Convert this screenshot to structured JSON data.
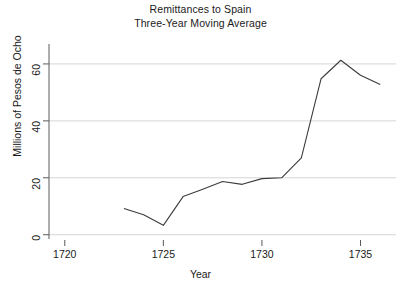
{
  "chart_data": {
    "type": "line",
    "title": "Remittances to Spain",
    "subtitle": "Three-Year Moving Average",
    "xlabel": "Year",
    "ylabel": "Millions of Pesos de Ocho",
    "xlim": [
      1719.2,
      1736.8
    ],
    "ylim": [
      -1.5,
      67
    ],
    "grid": true,
    "gridlines_y": [
      0,
      20,
      40,
      60
    ],
    "legend": null,
    "xticks": [
      1720,
      1725,
      1730,
      1735
    ],
    "xtick_labels": [
      "1720",
      "1725",
      "1730",
      "1735"
    ],
    "yticks": [
      0,
      20,
      40,
      60
    ],
    "ytick_labels": [
      "0",
      "20",
      "40",
      "60"
    ],
    "series": [
      {
        "name": "Remittances (3-yr moving average)",
        "color": "#3c3c3c",
        "x": [
          1723,
          1724,
          1725,
          1726,
          1727,
          1728,
          1729,
          1730,
          1731,
          1732,
          1733,
          1734,
          1735,
          1736
        ],
        "values": [
          9.2,
          7.0,
          3.3,
          13.4,
          16.0,
          18.7,
          17.7,
          19.7,
          20.0,
          27.0,
          54.8,
          61.3,
          56.0,
          52.8
        ]
      }
    ]
  },
  "axes": {
    "title_lines": [
      "Remittances to Spain",
      "Three-Year Moving Average"
    ],
    "x_axis_title": "Year",
    "y_axis_title": "Millions of Pesos de Ocho"
  }
}
